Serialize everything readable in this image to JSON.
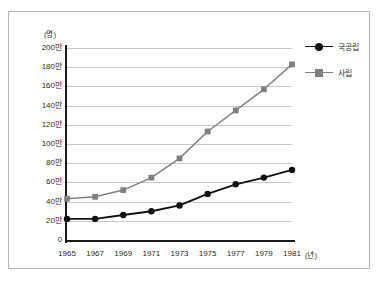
{
  "chart_data": {
    "type": "line",
    "title": "",
    "subtitle": "",
    "xlabel": "(년)",
    "ylabel": "(명)",
    "x": [
      1965,
      1967,
      1969,
      1971,
      1973,
      1975,
      1977,
      1979,
      1981
    ],
    "categories": [
      "1965",
      "1967",
      "1969",
      "1971",
      "1973",
      "1975",
      "1977",
      "1979",
      "1981"
    ],
    "xtick_labels": [
      "1965",
      "1967",
      "1969",
      "1971",
      "1973",
      "1975",
      "1977",
      "1979",
      "1981"
    ],
    "ytick_labels": [
      "0",
      "20만",
      "40만",
      "60만",
      "80만",
      "100만",
      "120만",
      "140만",
      "160만",
      "180만",
      "200만"
    ],
    "ytick_values": [
      0,
      20,
      40,
      60,
      80,
      100,
      120,
      140,
      160,
      180,
      200
    ],
    "ylim": [
      0,
      200
    ],
    "xlim": [
      1965,
      1981
    ],
    "y_unit": "만",
    "grid": "horizontal",
    "legend_position": "right-top",
    "series": [
      {
        "name": "국공립",
        "color": "#111111",
        "marker": "circle",
        "values": [
          22,
          22,
          26,
          30,
          36,
          48,
          58,
          65,
          73
        ]
      },
      {
        "name": "사립",
        "color": "#808080",
        "marker": "square",
        "values": [
          43,
          45,
          52,
          65,
          85,
          113,
          135,
          157,
          183
        ]
      }
    ]
  },
  "legend": {
    "items": [
      {
        "label": "국공립"
      },
      {
        "label": "사립"
      }
    ]
  },
  "axis": {
    "y_unit_label": "(명)",
    "x_unit_label": "(년)"
  },
  "colors": {
    "public_series": "#111111",
    "private_series": "#808080",
    "gridline": "#c9c9c9",
    "axis": "#1a1a1a",
    "frame": "#b4b4b4",
    "background": "#ffffff"
  }
}
